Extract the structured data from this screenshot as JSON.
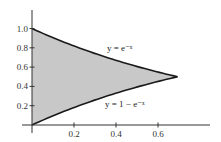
{
  "chart_data": {
    "type": "area",
    "title": "",
    "xlabel": "",
    "ylabel": "",
    "xlim": [
      0,
      0.85
    ],
    "ylim": [
      0,
      1.15
    ],
    "grid": false,
    "x_ticks": [
      "0.2",
      "0.4",
      "0.6"
    ],
    "y_ticks": [
      "0.2",
      "0.4",
      "0.6",
      "0.8",
      "1.0"
    ],
    "series": [
      {
        "name": "y = e^{-x}",
        "label": "y = e⁻ˣ",
        "x": [
          0,
          0.1,
          0.2,
          0.3,
          0.4,
          0.5,
          0.6,
          0.693
        ],
        "values": [
          1.0,
          0.905,
          0.819,
          0.741,
          0.67,
          0.607,
          0.549,
          0.5
        ]
      },
      {
        "name": "y = 1 - e^{-x}",
        "label": "y = 1 − e⁻ˣ",
        "x": [
          0,
          0.1,
          0.2,
          0.3,
          0.4,
          0.5,
          0.6,
          0.693
        ],
        "values": [
          0.0,
          0.095,
          0.181,
          0.259,
          0.33,
          0.393,
          0.451,
          0.5
        ]
      }
    ],
    "shaded_region": {
      "between": [
        "y = e^{-x}",
        "y = 1 - e^{-x}"
      ],
      "x_range": [
        0,
        0.693
      ],
      "fill": "#c8c8c8"
    },
    "intersection": {
      "x": 0.693,
      "y": 0.5
    },
    "colors": {
      "curve": "#1a1a1a",
      "axis": "#333333",
      "fill": "#c8c8c8"
    }
  }
}
